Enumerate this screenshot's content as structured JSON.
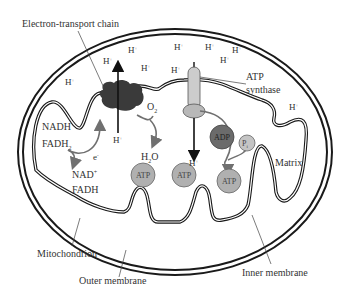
{
  "labels": {
    "electron_transport_chain": "Electron-transport chain",
    "atp_synthase_line1": "ATP",
    "atp_synthase_line2": "synthase",
    "matrix": "Matrix",
    "mitochondrion": "Mitochondrion",
    "outer_membrane": "Outer membrane",
    "inner_membrane": "Inner membrane"
  },
  "protons": {
    "symbol": "H",
    "charge": "+",
    "intermembrane_positions": [
      {
        "x": 65,
        "y": 85
      },
      {
        "x": 103,
        "y": 64
      },
      {
        "x": 128,
        "y": 53
      },
      {
        "x": 141,
        "y": 71
      },
      {
        "x": 171,
        "y": 73
      },
      {
        "x": 178,
        "y": 50
      },
      {
        "x": 205,
        "y": 50
      },
      {
        "x": 206,
        "y": 65
      },
      {
        "x": 225,
        "y": 53
      },
      {
        "x": 286,
        "y": 110
      }
    ],
    "matrix_positions": [
      {
        "x": 113,
        "y": 142
      },
      {
        "x": 192,
        "y": 166
      }
    ]
  },
  "molecules": {
    "nadh": "NADH",
    "fadh2_main": "FADH",
    "fadh2_sub": "2",
    "electron": "e",
    "electron_charge": "-",
    "nad_plus": "NAD",
    "nad_charge": "+",
    "fadh": "FADH",
    "o2_main": "O",
    "o2_sub": "2",
    "h2o_h": "H",
    "h2o_sub": "2",
    "h2o_o": "O",
    "adp": "ADP",
    "pi_main": "P",
    "pi_sub": "i",
    "atp": "ATP"
  },
  "atp_molecules": [
    {
      "x": 143,
      "y": 175,
      "label": "ATP"
    },
    {
      "x": 184,
      "y": 175,
      "label": "ATP"
    },
    {
      "x": 229,
      "y": 180,
      "label": "ATP"
    }
  ],
  "colors": {
    "membrane": "#1a1a1a",
    "etc_complex": "#3a3a3a",
    "adp_fill": "#6b6b6b",
    "atp_fill": "#b0b0b0",
    "pi_fill": "#c4c4c4",
    "synthase_fill": "#cccccc",
    "synthase_head": "#b8b8b8",
    "arrow_gray": "#707070",
    "text": "#333333"
  }
}
